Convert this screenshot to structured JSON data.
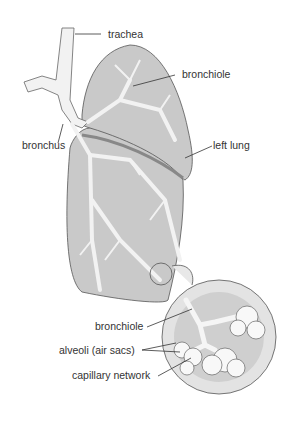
{
  "diagram": {
    "labels": {
      "trachea": "trachea",
      "bronchiole_top": "bronchiole",
      "bronchus": "bronchus",
      "left_lung": "left lung",
      "bronchiole_inset": "bronchiole",
      "alveoli": "alveoli (air sacs)",
      "capillary": "capillary network"
    },
    "colors": {
      "lung_fill": "#c9c9c9",
      "lung_dark": "#a6a6a6",
      "airway": "#f2f2f2",
      "outline": "#555555",
      "inset_bg": "#cfcfcf"
    }
  }
}
